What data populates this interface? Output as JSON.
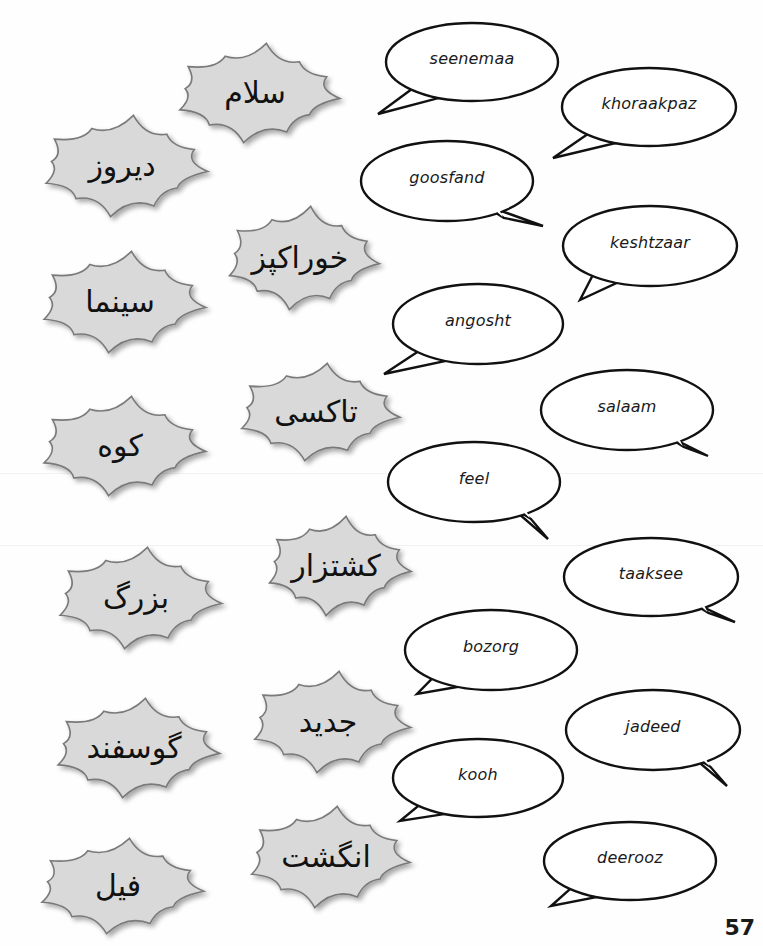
{
  "page": {
    "page_number": "57",
    "colors": {
      "burst_fill": "#d9d9d9",
      "burst_stroke": "#7a7a7a",
      "bubble_stroke": "#111111",
      "text": "#111111"
    }
  },
  "persian_words": [
    {
      "id": "salaam",
      "text": "سلام",
      "cx": 255,
      "cy": 93,
      "w": 190,
      "h": 100
    },
    {
      "id": "deerooz",
      "text": "دیروز",
      "cx": 122,
      "cy": 166,
      "w": 192,
      "h": 102
    },
    {
      "id": "khoraakpaz",
      "text": "خوراکپز",
      "cx": 300,
      "cy": 258,
      "w": 178,
      "h": 104
    },
    {
      "id": "seenemaa",
      "text": "سینما",
      "cx": 120,
      "cy": 302,
      "w": 192,
      "h": 102
    },
    {
      "id": "taaksee",
      "text": "تاکسی",
      "cx": 316,
      "cy": 412,
      "w": 188,
      "h": 98
    },
    {
      "id": "kooh",
      "text": "کوه",
      "cx": 120,
      "cy": 446,
      "w": 192,
      "h": 100
    },
    {
      "id": "keshtzaar",
      "text": "کشتزار",
      "cx": 336,
      "cy": 566,
      "w": 168,
      "h": 100
    },
    {
      "id": "bozorg",
      "text": "بزرگ",
      "cx": 136,
      "cy": 598,
      "w": 192,
      "h": 102
    },
    {
      "id": "jadeed",
      "text": "جدید",
      "cx": 328,
      "cy": 722,
      "w": 185,
      "h": 102
    },
    {
      "id": "goosfand",
      "text": "گوسفند",
      "cx": 134,
      "cy": 748,
      "w": 192,
      "h": 100
    },
    {
      "id": "angosht",
      "text": "انگشت",
      "cx": 326,
      "cy": 857,
      "w": 188,
      "h": 102
    },
    {
      "id": "feel",
      "text": "فیل",
      "cx": 118,
      "cy": 886,
      "w": 192,
      "h": 96
    }
  ],
  "transliterations": [
    {
      "id": "seenemaa",
      "text": "seenemaa",
      "cx": 472,
      "cy": 62,
      "rx": 86,
      "ry": 39,
      "tail": "left",
      "tx": 378,
      "ty": 114
    },
    {
      "id": "khoraakpaz",
      "text": "khoraakpaz",
      "cx": 649,
      "cy": 107,
      "rx": 87,
      "ry": 39,
      "tail": "left",
      "tx": 553,
      "ty": 158
    },
    {
      "id": "goosfand",
      "text": "goosfand",
      "cx": 447,
      "cy": 181,
      "rx": 86,
      "ry": 40,
      "tail": "right",
      "tx": 543,
      "ty": 226
    },
    {
      "id": "keshtzaar",
      "text": "keshtzaar",
      "cx": 650,
      "cy": 246,
      "rx": 87,
      "ry": 40,
      "tail": "left",
      "tx": 580,
      "ty": 300
    },
    {
      "id": "angosht",
      "text": "angosht",
      "cx": 478,
      "cy": 324,
      "rx": 85,
      "ry": 40,
      "tail": "left",
      "tx": 384,
      "ty": 374
    },
    {
      "id": "salaam",
      "text": "salaam",
      "cx": 627,
      "cy": 410,
      "rx": 86,
      "ry": 40,
      "tail": "right",
      "tx": 708,
      "ty": 456
    },
    {
      "id": "feel",
      "text": "feel",
      "cx": 474,
      "cy": 482,
      "rx": 86,
      "ry": 40,
      "tail": "right",
      "tx": 548,
      "ty": 539
    },
    {
      "id": "taaksee",
      "text": "taaksee",
      "cx": 651,
      "cy": 577,
      "rx": 87,
      "ry": 39,
      "tail": "right",
      "tx": 735,
      "ty": 622
    },
    {
      "id": "bozorg",
      "text": "bozorg",
      "cx": 491,
      "cy": 650,
      "rx": 86,
      "ry": 40,
      "tail": "left",
      "tx": 417,
      "ty": 694
    },
    {
      "id": "jadeed",
      "text": "jadeed",
      "cx": 653,
      "cy": 730,
      "rx": 87,
      "ry": 40,
      "tail": "right",
      "tx": 727,
      "ty": 786
    },
    {
      "id": "kooh",
      "text": "kooh",
      "cx": 478,
      "cy": 778,
      "rx": 85,
      "ry": 39,
      "tail": "left",
      "tx": 400,
      "ty": 821
    },
    {
      "id": "deerooz",
      "text": "deerooz",
      "cx": 630,
      "cy": 861,
      "rx": 86,
      "ry": 39,
      "tail": "left",
      "tx": 551,
      "ty": 906
    }
  ]
}
